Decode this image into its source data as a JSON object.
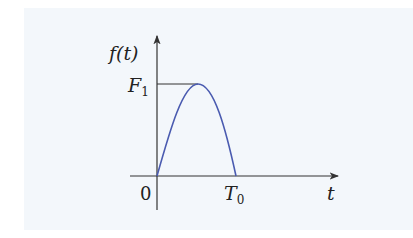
{
  "diagram": {
    "y_axis_label": "f(t)",
    "x_axis_label": "t",
    "origin_label": "0",
    "peak_label": "F",
    "peak_subscript": "1",
    "end_label": "T",
    "end_subscript": "0",
    "curve_color": "#4a5bb0",
    "axis_color": "#333333"
  }
}
